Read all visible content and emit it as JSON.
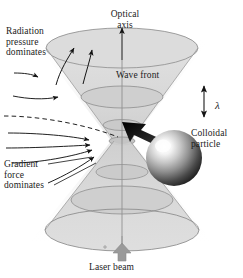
{
  "figure": {
    "labels": {
      "radiation_pressure": "Radiation\npressure\ndominates",
      "optical_axis": "Optical\naxis",
      "wave_front": "Wave front",
      "wavelength": "λ",
      "colloidal_particle": "Colloidal\nparticle",
      "gradient_force": "Gradient\nforce\ndominates",
      "laser_beam": "Laser beam"
    },
    "colors": {
      "background": "#ffffff",
      "text": "#1b1b1b",
      "beam_fill": "#d9d9d9",
      "beam_fill_light": "#e6e6e6",
      "wavefront_stroke": "#8c8c8c",
      "arrow_stroke": "#1b1b1b",
      "laser_arrow": "#9a9a9a",
      "particle_highlight": "#ffffff",
      "particle_shadow": "#111111",
      "force_arrow": "#151515"
    },
    "elements": {
      "beam_shape": "double-cone-hourglass",
      "wavefront_count": 6,
      "upper_cone_arrows": 2,
      "left_field_arrows": 6,
      "dashed_ray": 1,
      "particle_shape": "sphere"
    }
  }
}
